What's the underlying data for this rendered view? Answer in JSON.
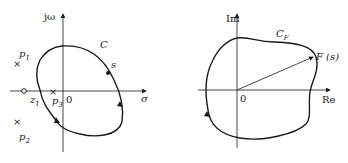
{
  "left_plot": {
    "plane": "s-plane",
    "axes": {
      "vertical_label": "jω",
      "horizontal_label": "σ",
      "origin_label": "0"
    },
    "contour_label": "C",
    "point_label": "s",
    "poles": [
      {
        "name": "p",
        "sub": "1"
      },
      {
        "name": "p",
        "sub": "2"
      },
      {
        "name": "p",
        "sub": "3"
      }
    ],
    "zeros": [
      {
        "name": "z",
        "sub": "1"
      }
    ]
  },
  "right_plot": {
    "plane": "F(s)-plane",
    "axes": {
      "vertical_label": "Im",
      "horizontal_label": "Re",
      "origin_label": "0"
    },
    "contour_label": "C",
    "contour_sub": "F",
    "vector_label": "F (s)"
  },
  "colors": {
    "stroke": "#1a1a1a",
    "background": "#ffffff"
  }
}
